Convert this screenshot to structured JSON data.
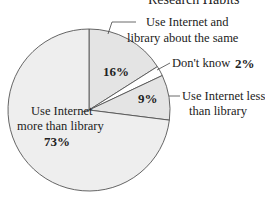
{
  "chart_data": {
    "type": "pie",
    "title": "Research Habits",
    "categories": [
      "Use Internet and library about the same",
      "Don't know",
      "Use Internet less than library",
      "Use Internet more than library"
    ],
    "values": [
      16,
      2,
      9,
      73
    ],
    "value_labels": [
      "16%",
      "2%",
      "9%",
      "73%"
    ],
    "start_angle": "12 o'clock, clockwise",
    "colors": [
      "#e4e4e4",
      "#ffffff",
      "#e4e4e4",
      "#eeeeee"
    ],
    "legend": "none (callout labels)"
  },
  "labels": {
    "title": "Research Habits",
    "same_line1": "Use Internet and",
    "same_line2": "library about the same",
    "same_pct": "16%",
    "dontknow": "Don't know",
    "dontknow_pct": "2%",
    "less_line1": "Use Internet less",
    "less_line2": "than library",
    "less_pct": "9%",
    "more_line1": "Use Internet",
    "more_line2": "more than library",
    "more_pct": "73%"
  }
}
